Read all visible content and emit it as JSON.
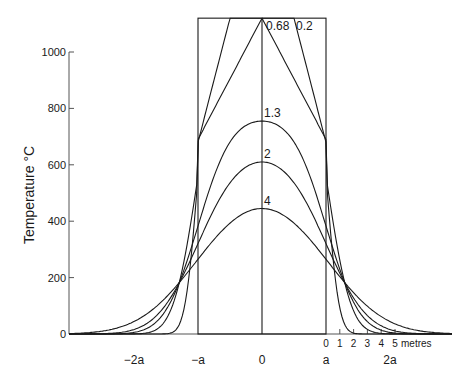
{
  "chart_data": {
    "type": "line",
    "title": "",
    "xlabel": "",
    "ylabel": "Temperature °C",
    "ylim": [
      0,
      1120
    ],
    "yticks": [
      0,
      200,
      400,
      600,
      800,
      1000
    ],
    "ytick_labels": [
      "0",
      "200",
      "400",
      "600",
      "800",
      "1000"
    ],
    "xticks": [
      {
        "x": -2,
        "label": "−2a"
      },
      {
        "x": -1,
        "label": "−a"
      },
      {
        "x": 0,
        "label": "0"
      },
      {
        "x": 1,
        "label": "a"
      },
      {
        "x": 2,
        "label": "2a"
      }
    ],
    "scale_bar": {
      "labels": [
        "0",
        "1",
        "2",
        "3",
        "4",
        "5"
      ],
      "unit": "metres"
    },
    "grid": false,
    "legend": null,
    "initial_temperature": 1120,
    "half_width_label": "a",
    "series": [
      {
        "name": "0.2",
        "peak": 1120,
        "edge_value": 680,
        "spread": 0.22
      },
      {
        "name": "0.68",
        "peak": 1110,
        "edge_value": 690,
        "spread": 0.42
      },
      {
        "name": "1.3",
        "peak": 755,
        "edge_value": 650,
        "spread": 0.58
      },
      {
        "name": "2",
        "peak": 610,
        "edge_value": 560,
        "spread": 0.72
      },
      {
        "name": "4",
        "peak": 445,
        "edge_value": 420,
        "spread": 1.02
      }
    ],
    "sampled_values": {
      "x": [
        -2.8,
        -2,
        -1,
        0,
        1,
        2,
        2.8
      ],
      "0.2": [
        0,
        10,
        690,
        1120,
        690,
        10,
        0
      ],
      "0.68": [
        0,
        60,
        690,
        1110,
        690,
        60,
        0
      ],
      "1.3": [
        65,
        250,
        650,
        755,
        650,
        250,
        65
      ],
      "2": [
        165,
        320,
        530,
        610,
        530,
        320,
        165
      ],
      "4": [
        265,
        340,
        420,
        445,
        420,
        340,
        265
      ]
    }
  },
  "labels": {
    "ylabel": "Temperature °C",
    "curve_labels": [
      "0.68",
      "0.2",
      "1.3",
      "2",
      "4"
    ],
    "metres": "metres"
  }
}
